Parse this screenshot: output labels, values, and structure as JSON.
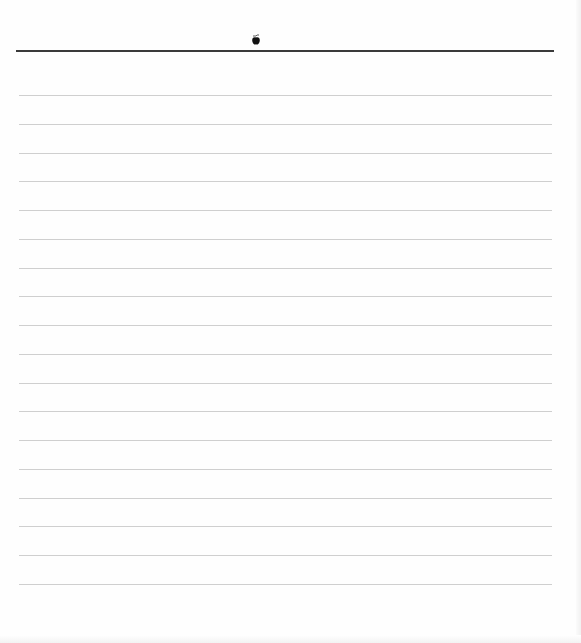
{
  "page": {
    "type": "lined-notebook-page",
    "header": {
      "logo_icon": "apple-logo-icon"
    },
    "line_count": 18,
    "lines_text": [
      "",
      "",
      "",
      "",
      "",
      "",
      "",
      "",
      "",
      "",
      "",
      "",
      "",
      "",
      "",
      "",
      "",
      ""
    ]
  },
  "colors": {
    "background": "#fefefe",
    "header_rule": "#3a3a3a",
    "ruled_line": "#cfcfcf"
  }
}
